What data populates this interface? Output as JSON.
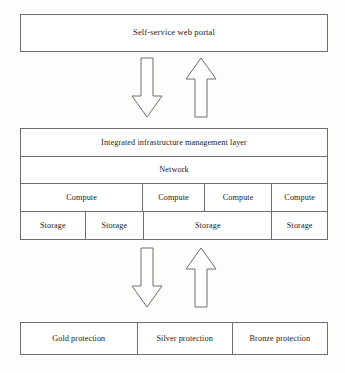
{
  "diagram": {
    "title_text": "Self-service web portal",
    "portal": {
      "label": "Self-service web portal"
    },
    "infrastructure": {
      "management_layer": "Integrated infrastructure management layer",
      "network": "Network",
      "compute_cells": [
        {
          "label": "Compute",
          "flex": 40
        },
        {
          "label": "Compute",
          "flex": 20
        },
        {
          "label": "Compute",
          "flex": 22
        },
        {
          "label": "Compute",
          "flex": 18
        }
      ],
      "storage_cells": [
        {
          "label": "Storage",
          "flex": 21
        },
        {
          "label": "Storage",
          "flex": 19
        },
        {
          "label": "Storage",
          "flex": 42
        },
        {
          "label": "Storage",
          "flex": 18
        }
      ]
    },
    "protection": {
      "tiers": [
        {
          "label": "Gold protection",
          "flex": 38
        },
        {
          "label": "Silver protection",
          "flex": 31
        },
        {
          "label": "Bronze protection",
          "flex": 31
        }
      ]
    },
    "arrows": [
      {
        "name": "arrow-down-top",
        "direction": "down"
      },
      {
        "name": "arrow-up-top",
        "direction": "up"
      },
      {
        "name": "arrow-down-bottom",
        "direction": "down"
      },
      {
        "name": "arrow-up-bottom",
        "direction": "up"
      }
    ],
    "colors": {
      "background": "#fdfdfb",
      "box_fill": "#ffffff",
      "line": "#6e6e6e",
      "text": "#1a1a1a"
    }
  }
}
